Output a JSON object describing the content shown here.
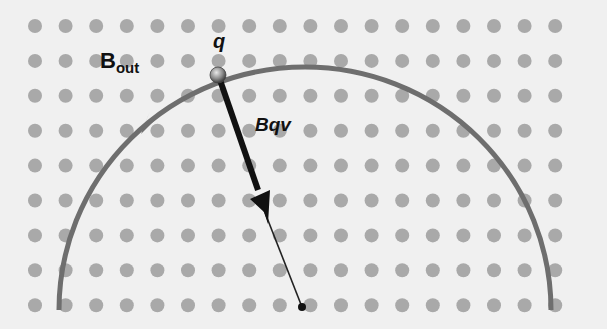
{
  "diagram": {
    "field_label": {
      "main": "B",
      "sub": "out"
    },
    "charge_label": "q",
    "force_label": "Bqv",
    "colors": {
      "background": "#f0f0f0",
      "field_dots": "#a9a9a9",
      "path": "#6e6e6e",
      "arrow": "#111111",
      "charge": "#8a8a8a"
    },
    "grid": {
      "x0": 35,
      "dx": 30.6,
      "cols": 18,
      "y0": 26,
      "dy": 34.9,
      "rows": 9,
      "r": 7
    },
    "path": {
      "cx": 305,
      "cy": 310,
      "rx": 246,
      "ry": 243,
      "direction": "counterclockwise"
    },
    "charge_position": [
      218,
      73
    ],
    "center_point": [
      302,
      307
    ],
    "force_arrow": {
      "from": [
        218,
        73
      ],
      "to": [
        265,
        212
      ]
    }
  }
}
